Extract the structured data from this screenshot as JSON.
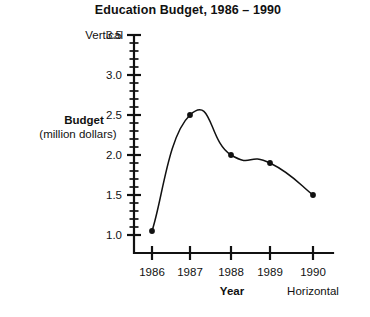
{
  "chart_data": {
    "type": "line",
    "title": "Education Budget, 1986 – 1990",
    "categories": [
      "1986",
      "1987",
      "1988",
      "1989",
      "1990"
    ],
    "values": [
      1.05,
      2.5,
      2.0,
      1.9,
      1.5
    ],
    "series": [
      {
        "name": "Budget",
        "values": [
          1.05,
          2.5,
          2.0,
          1.9,
          1.5
        ]
      }
    ],
    "xlabel": "Year",
    "ylabel": "Budget",
    "ylabel_units": "(million dollars)",
    "ylim": [
      1.0,
      3.5
    ],
    "ytick_labels": [
      "1.0",
      "1.5",
      "2.0",
      "2.5",
      "3.0",
      "3.5"
    ],
    "ytick_values": [
      1.0,
      1.5,
      2.0,
      2.5,
      3.0,
      3.5
    ],
    "yminor_step": 0.1,
    "xtick_labels": [
      "1986",
      "1987",
      "1988",
      "1989",
      "1990"
    ],
    "grid": false,
    "legend": false,
    "line_color": "#111111",
    "marker_color": "#111111",
    "background_color": "#ffffff",
    "annotations": [
      {
        "text": "Vertical",
        "target": "y-axis"
      },
      {
        "text": "Horizontal",
        "target": "x-axis"
      }
    ]
  },
  "labels": {
    "title": "Education Budget, 1986 – 1990",
    "y_axis_title": "Budget",
    "y_axis_units": "(million dollars)",
    "x_axis_title": "Year",
    "vertical_annotation": "Vertical",
    "horizontal_annotation": "Horizontal",
    "ytick_1": "1.0",
    "ytick_2": "1.5",
    "ytick_3": "2.0",
    "ytick_4": "2.5",
    "ytick_5": "3.0",
    "ytick_6": "3.5",
    "xtick_1": "1986",
    "xtick_2": "1987",
    "xtick_3": "1988",
    "xtick_4": "1989",
    "xtick_5": "1990"
  }
}
